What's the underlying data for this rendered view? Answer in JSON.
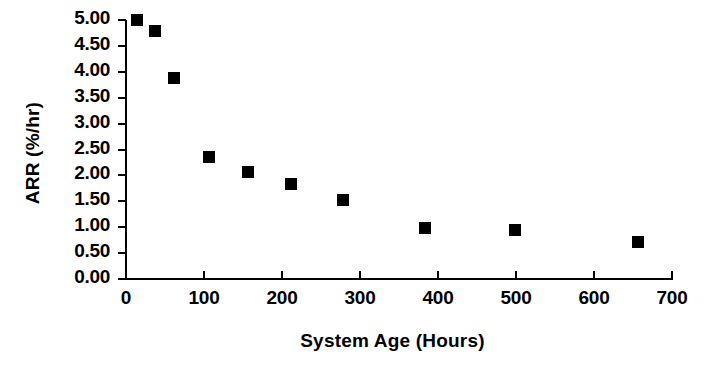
{
  "chart_data": {
    "type": "scatter",
    "title": "",
    "xlabel": "System Age (Hours)",
    "ylabel": "ARR (%/hr)",
    "xlim": [
      0,
      700
    ],
    "ylim": [
      0,
      5.0
    ],
    "grid": false,
    "legend": null,
    "marker": "filled-square",
    "marker_color": "#000000",
    "xticks": [
      0,
      100,
      200,
      300,
      400,
      500,
      600,
      700
    ],
    "xtick_labels": [
      "0",
      "100",
      "200",
      "300",
      "400",
      "500",
      "600",
      "700"
    ],
    "yticks": [
      0.0,
      0.5,
      1.0,
      1.5,
      2.0,
      2.5,
      3.0,
      3.5,
      4.0,
      4.5,
      5.0
    ],
    "ytick_labels": [
      "0.00",
      "0.50",
      "1.00",
      "1.50",
      "2.00",
      "2.50",
      "3.00",
      "3.50",
      "4.00",
      "4.50",
      "5.00"
    ],
    "x": [
      14,
      37,
      62,
      106,
      156,
      212,
      278,
      383,
      499,
      656
    ],
    "y": [
      5.0,
      4.78,
      3.88,
      2.35,
      2.06,
      1.84,
      1.52,
      0.98,
      0.94,
      0.71
    ],
    "points": [
      {
        "x": 14,
        "y": 5.0
      },
      {
        "x": 37,
        "y": 4.78
      },
      {
        "x": 62,
        "y": 3.88
      },
      {
        "x": 106,
        "y": 2.35
      },
      {
        "x": 156,
        "y": 2.06
      },
      {
        "x": 212,
        "y": 1.84
      },
      {
        "x": 278,
        "y": 1.52
      },
      {
        "x": 383,
        "y": 0.98
      },
      {
        "x": 499,
        "y": 0.94
      },
      {
        "x": 656,
        "y": 0.71
      }
    ]
  },
  "figure": {
    "background": "#ffffff",
    "axis_color": "#000000"
  }
}
